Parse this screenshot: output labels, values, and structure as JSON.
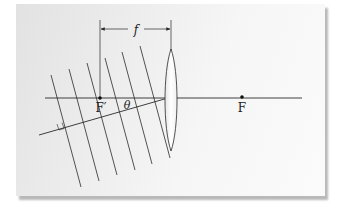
{
  "diagram": {
    "type": "optics-lens-wavefronts",
    "labels": {
      "focal_length": "f",
      "front_focus": "F′",
      "back_focus": "F",
      "angle": "θ"
    },
    "colors": {
      "line": "#2a2a2a",
      "card_bg": "#f2f2f2",
      "shadow": "#b9b9b9"
    }
  }
}
